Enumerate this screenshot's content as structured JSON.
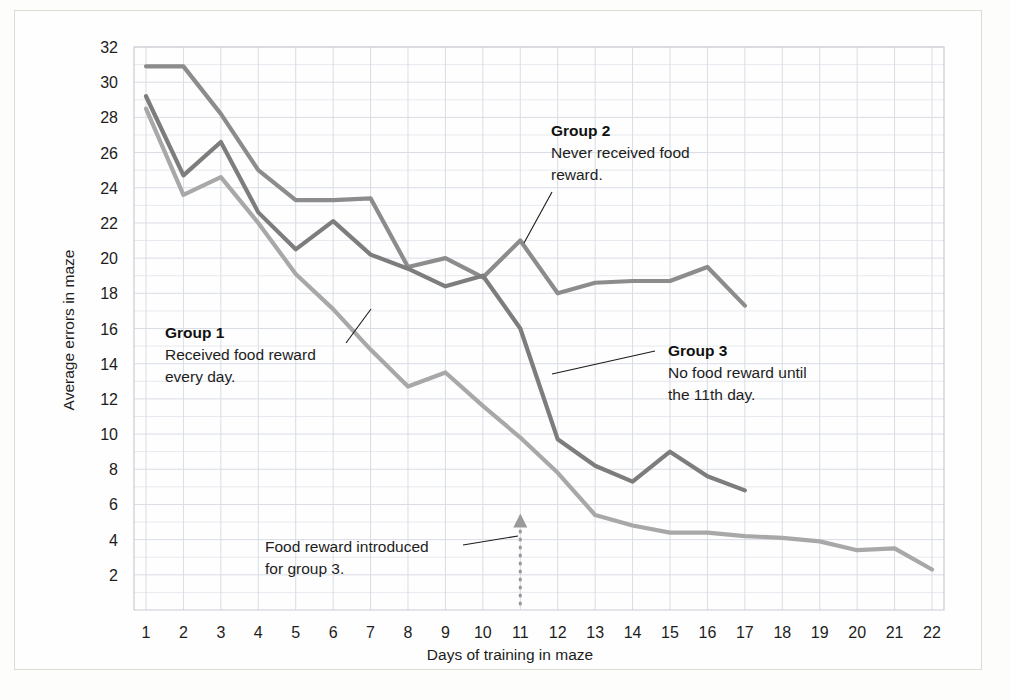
{
  "figure": {
    "background_color": "#fdfdfc",
    "border_color": "#dcdcd8"
  },
  "chart_data": {
    "type": "line",
    "title": "",
    "xlabel": "Days of training in maze",
    "ylabel": "Average errors in maze",
    "xlim": [
      1,
      22
    ],
    "ylim": [
      0,
      32
    ],
    "grid": true,
    "legend_position": "inline-annotations",
    "xticks": [
      "1",
      "2",
      "3",
      "4",
      "5",
      "6",
      "7",
      "8",
      "9",
      "10",
      "11",
      "12",
      "13",
      "14",
      "15",
      "16",
      "17",
      "18",
      "19",
      "20",
      "21",
      "22"
    ],
    "yticks": [
      "2",
      "4",
      "6",
      "8",
      "10",
      "12",
      "14",
      "16",
      "18",
      "20",
      "22",
      "24",
      "26",
      "28",
      "30",
      "32"
    ],
    "x": [
      1,
      2,
      3,
      4,
      5,
      6,
      7,
      8,
      9,
      10,
      11,
      12,
      13,
      14,
      15,
      16,
      17,
      18,
      19,
      20,
      21,
      22
    ],
    "series": [
      {
        "name": "Group 1",
        "color": "#a8a8a8",
        "description": "Received food reward every day.",
        "values": [
          28.5,
          23.6,
          24.6,
          22.0,
          19.1,
          17.1,
          14.8,
          12.7,
          13.5,
          11.6,
          9.8,
          7.8,
          5.4,
          4.8,
          4.4,
          4.4,
          4.2,
          4.1,
          3.9,
          3.4,
          3.5,
          2.3
        ]
      },
      {
        "name": "Group 2",
        "color": "#8c8c8c",
        "description": "Never received food reward.",
        "values": [
          30.9,
          30.9,
          28.2,
          25.0,
          23.3,
          23.3,
          23.4,
          19.5,
          20.0,
          18.9,
          21.0,
          18.0,
          18.6,
          18.7,
          18.7,
          19.5,
          17.3,
          null,
          null,
          null,
          null,
          null
        ]
      },
      {
        "name": "Group 3",
        "color": "#7d7d7d",
        "description": "No food reward until the 11th day.",
        "values": [
          29.2,
          24.7,
          26.6,
          22.6,
          20.5,
          22.1,
          20.2,
          19.4,
          18.4,
          19.0,
          16.0,
          9.7,
          8.2,
          7.3,
          9.0,
          7.6,
          6.8,
          null,
          null,
          null,
          null,
          null
        ]
      }
    ],
    "annotations": [
      {
        "id": "group-1",
        "title": "Group 1",
        "lines": [
          "Received food reward",
          "every day."
        ],
        "leader_target_day": 7
      },
      {
        "id": "group-2",
        "title": "Group 2",
        "lines": [
          "Never received food",
          "reward."
        ],
        "leader_target_day": 11
      },
      {
        "id": "group-3",
        "title": "Group 3",
        "lines": [
          "No food reward until",
          "the 11th day."
        ],
        "leader_target_day": 12
      },
      {
        "id": "food-reward-intro",
        "title": "",
        "lines": [
          "Food reward introduced",
          "for group 3."
        ],
        "marker_day": 11,
        "marker_style": "dotted-arrow-up"
      }
    ]
  }
}
